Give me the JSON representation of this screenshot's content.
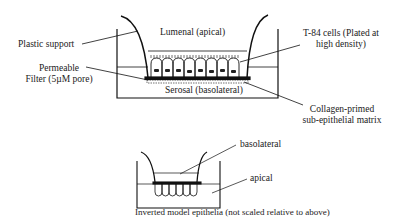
{
  "diagram": {
    "top_model": {
      "labels": {
        "lumenal": "Lumenal (apical)",
        "plastic_support": "Plastic support",
        "permeable_filter_line1": "Permeable",
        "permeable_filter_line2": "Filter (5µM pore)",
        "serosal": "Serosal (basolateral)",
        "t84_line1": "T-84 cells (Plated at",
        "t84_line2": "high density)",
        "collagen_line1": "Collagen-primed",
        "collagen_line2": "sub-epithelial matrix"
      },
      "cell_count": 8
    },
    "bottom_model": {
      "labels": {
        "basolateral": "basolateral",
        "apical": "apical",
        "caption": "Inverted model epithelia (not scaled relative to above)"
      },
      "cell_count": 7
    },
    "colors": {
      "line": "#111111",
      "background": "#ffffff"
    }
  }
}
